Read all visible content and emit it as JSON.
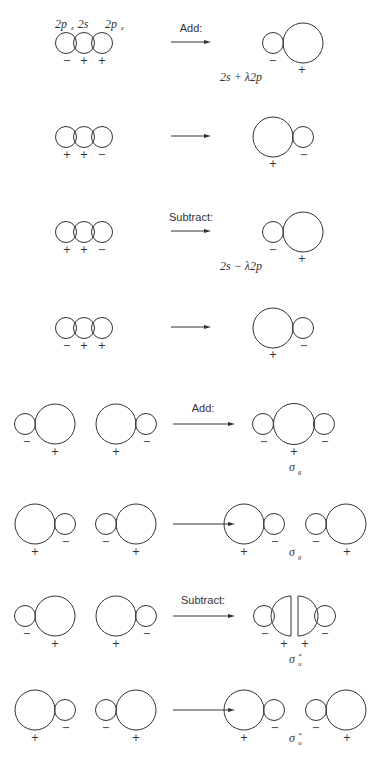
{
  "figure": {
    "header_labels": [
      "2p",
      "2s",
      "2p"
    ],
    "header_subscript": "z",
    "stroke_color": "#333333",
    "background": "#ffffff"
  },
  "hybrid_rows": [
    {
      "id": "row1",
      "y": 43,
      "input_signs": [
        "−",
        "+",
        "+"
      ],
      "operation": "Add:",
      "result_shape": "small-left-large-right",
      "result_signs": {
        "small": "−",
        "large": "+"
      },
      "result_label": "2s + λ2p"
    },
    {
      "id": "row2",
      "y": 137,
      "input_signs": [
        "+",
        "+",
        "−"
      ],
      "operation": "",
      "result_shape": "large-left-small-right",
      "result_signs": {
        "small": "−",
        "large": "+"
      },
      "result_label": ""
    },
    {
      "id": "row3",
      "y": 232,
      "input_signs": [
        "+",
        "+",
        "−"
      ],
      "operation": "Subtract:",
      "result_shape": "small-left-large-right",
      "result_signs": {
        "small": "−",
        "large": "+"
      },
      "result_label": "2s − λ2p"
    },
    {
      "id": "row4",
      "y": 328,
      "input_signs": [
        "−",
        "+",
        "+"
      ],
      "operation": "",
      "result_shape": "large-left-small-right",
      "result_signs": {
        "small": "−",
        "large": "+"
      },
      "result_label": ""
    }
  ],
  "mo_rows": [
    {
      "id": "row5",
      "y": 424,
      "operation": "Add:",
      "result_type": "sigma-g-combined",
      "result_label": "σ",
      "result_sub": "g",
      "result_sup": ""
    },
    {
      "id": "row6",
      "y": 524,
      "operation": "",
      "result_type": "sigma-g-split",
      "result_label": "σ",
      "result_sub": "g",
      "result_sup": ""
    },
    {
      "id": "row7",
      "y": 616,
      "operation": "Subtract:",
      "result_type": "sigma-u-star-node",
      "result_label": "σ",
      "result_sub": "u",
      "result_sup": "*"
    },
    {
      "id": "row8",
      "y": 710,
      "operation": "",
      "result_type": "sigma-u-star-split",
      "result_label": "σ",
      "result_sub": "u",
      "result_sup": "*"
    }
  ],
  "signs": {
    "plus": "+",
    "minus": "−"
  }
}
